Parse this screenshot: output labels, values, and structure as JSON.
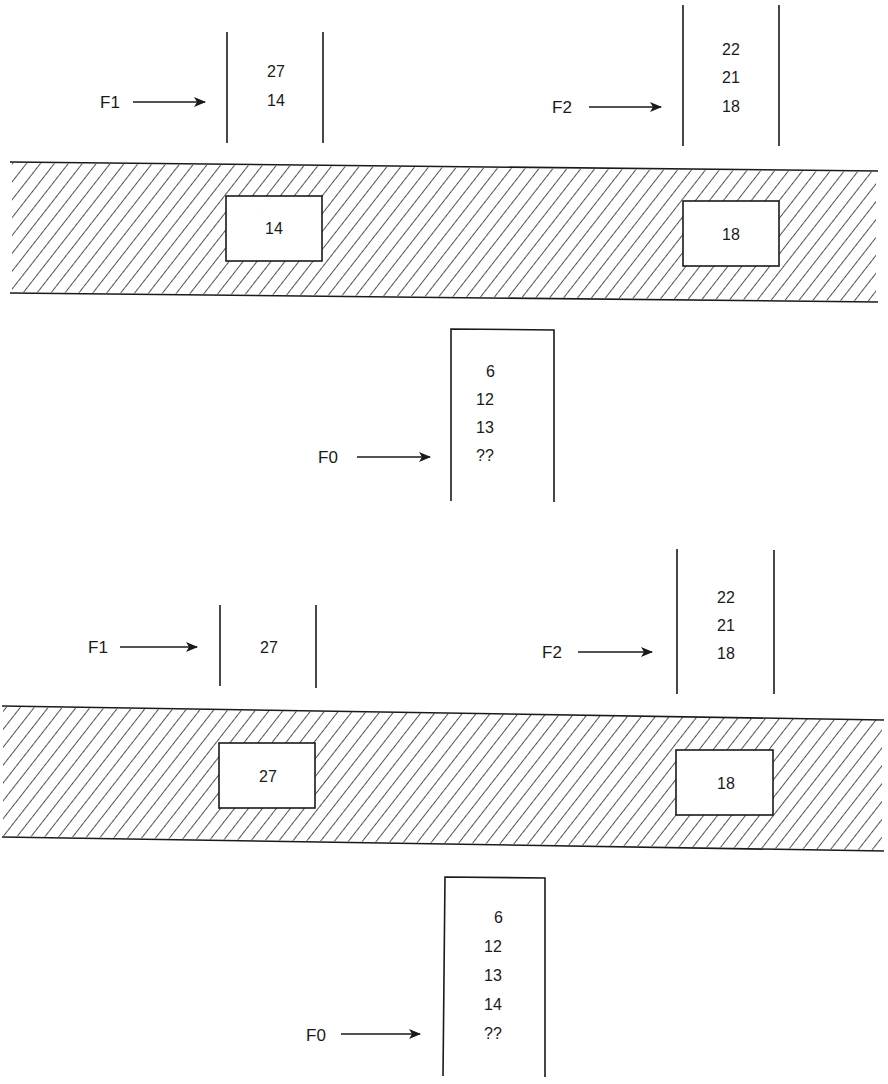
{
  "panels": [
    {
      "name": "before",
      "f1": {
        "label": "F1",
        "values": [
          "27",
          "14"
        ]
      },
      "f2": {
        "label": "F2",
        "values": [
          "22",
          "21",
          "18"
        ]
      },
      "buffers": {
        "left": "14",
        "right": "18"
      },
      "f0": {
        "label": "F0",
        "values": [
          "6",
          "12",
          "13",
          "??"
        ]
      }
    },
    {
      "name": "after",
      "f1": {
        "label": "F1",
        "values": [
          "27"
        ]
      },
      "f2": {
        "label": "F2",
        "values": [
          "22",
          "21",
          "18"
        ]
      },
      "buffers": {
        "left": "27",
        "right": "18"
      },
      "f0": {
        "label": "F0",
        "values": [
          "6",
          "12",
          "13",
          "14",
          "??"
        ]
      }
    }
  ],
  "colors": {
    "ink": "#1a1a1a",
    "paper": "#ffffff"
  }
}
